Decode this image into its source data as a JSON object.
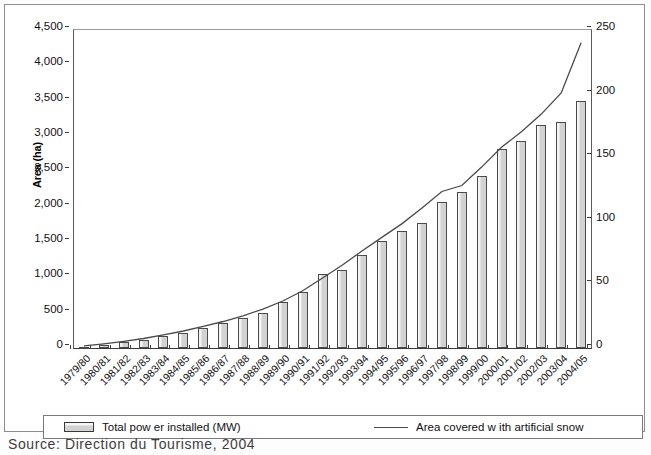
{
  "chart_data": {
    "type": "bar",
    "title": "",
    "xlabel": "",
    "ylabel": "Area (ha)",
    "y2label": "Installed Power (Megawatts)",
    "ylim": [
      0,
      4500
    ],
    "y2lim": [
      0,
      250
    ],
    "yticks": [
      "0",
      "500",
      "1,000",
      "1,500",
      "2,000",
      "2,500",
      "3,000",
      "3,500",
      "4,000",
      "4,500"
    ],
    "ytick_values": [
      0,
      500,
      1000,
      1500,
      2000,
      2500,
      3000,
      3500,
      4000,
      4500
    ],
    "y2ticks": [
      "0",
      "50",
      "100",
      "150",
      "200",
      "250"
    ],
    "y2tick_values": [
      0,
      50,
      100,
      150,
      200,
      250
    ],
    "grid": false,
    "legend_position": "bottom",
    "categories": [
      "1979/80",
      "1980/81",
      "1981/82",
      "1982/83",
      "1983/84",
      "1984/85",
      "1985/86",
      "1986/87",
      "1987/88",
      "1988/89",
      "1989/90",
      "1990/91",
      "1991/92",
      "1992/93",
      "1993/94",
      "1994/95",
      "1995/96",
      "1996/97",
      "1997/98",
      "1998/99",
      "1999/00",
      "2000/01",
      "2001/02",
      "2002/03",
      "2003/04",
      "2004/05"
    ],
    "series": [
      {
        "name": "Total pow er installed (MW)",
        "type": "bar",
        "axis": "left",
        "unit": "MW",
        "values": [
          20,
          45,
          85,
          110,
          170,
          215,
          290,
          350,
          420,
          500,
          650,
          790,
          1050,
          1110,
          1320,
          1520,
          1660,
          1770,
          2070,
          2210,
          2440,
          2810,
          2930,
          3150,
          3200,
          3500
        ]
      },
      {
        "name": "Area covered w ith artificial snow",
        "type": "line",
        "axis": "left",
        "values": [
          30,
          60,
          95,
          135,
          185,
          240,
          305,
          375,
          455,
          550,
          665,
          810,
          990,
          1175,
          1375,
          1570,
          1760,
          1980,
          2215,
          2300,
          2560,
          2840,
          3060,
          3310,
          3610,
          4320
        ]
      }
    ]
  },
  "legend": {
    "bar_label": "Total pow er installed (MW)",
    "line_label": "Area covered w ith artificial snow"
  },
  "source_note": "Source: Direction du Tourisme, 2004"
}
